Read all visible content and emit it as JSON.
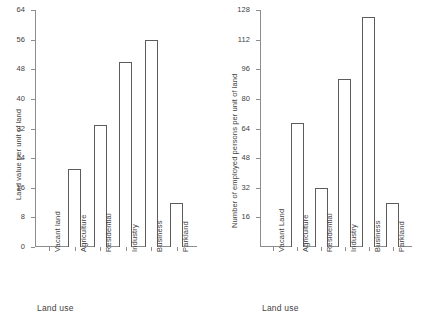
{
  "chart_data": [
    {
      "type": "bar",
      "title": "",
      "panel": "left",
      "categories": [
        "Vacant land",
        "Agriculture",
        "Residential",
        "Industry",
        "Business",
        "Parkland"
      ],
      "values": [
        0,
        21,
        33,
        50,
        56,
        12
      ],
      "xlabel": "Land use",
      "ylabel": "Land value per unit of land",
      "ylim": [
        0,
        64
      ],
      "yticks": [
        0,
        8,
        16,
        24,
        32,
        40,
        48,
        56,
        64
      ],
      "ytick_labels": [
        "0",
        "8",
        "16",
        "24",
        "32",
        "40",
        "48",
        "56",
        "64"
      ],
      "grid": false,
      "legend": "none",
      "bar_fill": "#ffffff",
      "bar_edge": "#5c5c5c",
      "axis_color": "#8d8d8d"
    },
    {
      "type": "bar",
      "title": "",
      "panel": "right",
      "categories": [
        "Vacant Land",
        "Agriculture",
        "Residential",
        "Industry",
        "Business",
        "Parkland"
      ],
      "values": [
        0,
        67,
        32,
        91,
        124,
        24
      ],
      "xlabel": "Land use",
      "ylabel": "Number of employed persons per unit of land",
      "ylim": [
        0,
        128
      ],
      "yticks": [
        16,
        32,
        48,
        64,
        80,
        96,
        112,
        128
      ],
      "ytick_labels": [
        "16",
        "32",
        "48",
        "64",
        "80",
        "96",
        "112",
        "128"
      ],
      "grid": false,
      "legend": "none",
      "bar_fill": "#ffffff",
      "bar_edge": "#5c5c5c",
      "axis_color": "#8d8d8d"
    }
  ]
}
